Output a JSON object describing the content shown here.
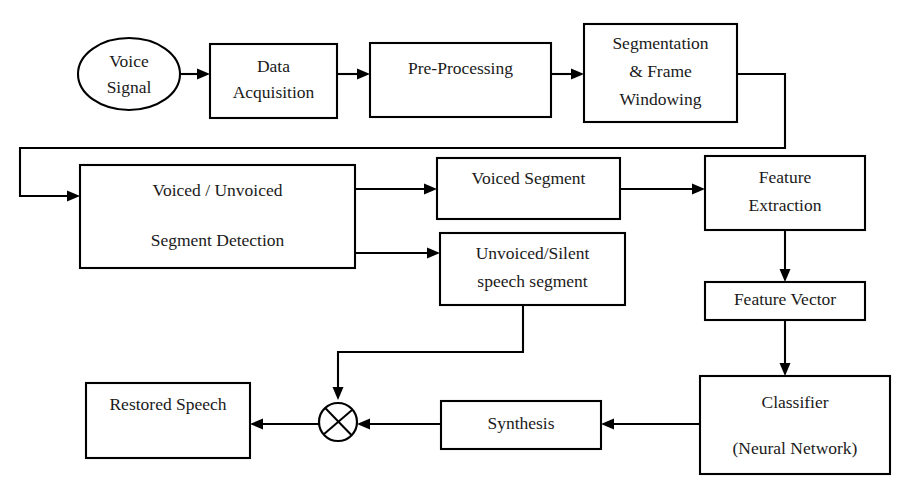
{
  "diagram": {
    "background_color": "#ffffff",
    "line_color": "#000000",
    "text_color": "#1a1a1a",
    "nodes": {
      "voice_signal": {
        "line1": "Voice",
        "line2": "Signal"
      },
      "data_acquisition": {
        "line1": "Data",
        "line2": "Acquisition"
      },
      "pre_processing": {
        "line1": "Pre-Processing"
      },
      "segmentation": {
        "line1": "Segmentation",
        "line2": "& Frame",
        "line3": "Windowing"
      },
      "vuv_detection": {
        "line1": "Voiced / Unvoiced",
        "line2": "Segment Detection"
      },
      "voiced_segment": {
        "line1": "Voiced Segment"
      },
      "unvoiced_segment": {
        "line1": "Unvoiced/Silent",
        "line2": "speech segment"
      },
      "feature_extraction": {
        "line1": "Feature",
        "line2": "Extraction"
      },
      "feature_vector": {
        "line1": "Feature Vector"
      },
      "classifier": {
        "line1": "Classifier",
        "line2": "(Neural Network)"
      },
      "synthesis": {
        "line1": "Synthesis"
      },
      "restored_speech": {
        "line1": "Restored Speech"
      },
      "summing_junction": {
        "symbol": "crossed-circle"
      }
    }
  }
}
